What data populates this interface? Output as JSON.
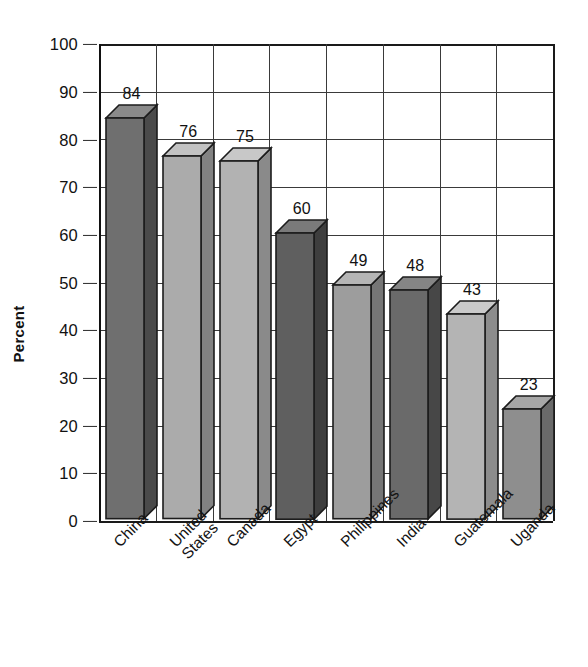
{
  "chart_data": {
    "type": "bar",
    "title": "",
    "xlabel": "",
    "ylabel": "Percent",
    "ylim": [
      0,
      100
    ],
    "ytick_step": 10,
    "yticks": [
      100,
      90,
      80,
      70,
      60,
      50,
      40,
      30,
      20,
      10,
      0
    ],
    "grid": "both",
    "legend": "none",
    "style": "3d-bar-grayscale",
    "categories": [
      "China",
      "United States",
      "Canada",
      "Egypt",
      "Philippines",
      "India",
      "Guatemala",
      "Uganda"
    ],
    "category_lines": [
      [
        "China"
      ],
      [
        "United",
        "States"
      ],
      [
        "Canada"
      ],
      [
        "Egypt"
      ],
      [
        "Philippines"
      ],
      [
        "India"
      ],
      [
        "Guatemala"
      ],
      [
        "Uganda"
      ]
    ],
    "values": [
      84,
      76,
      75,
      60,
      49,
      48,
      43,
      23
    ],
    "value_labels": [
      "84",
      "76",
      "75",
      "60",
      "49",
      "48",
      "43",
      "23"
    ],
    "bar_colors": [
      "#6f6f6f",
      "#ababab",
      "#b2b2b2",
      "#5f5f5f",
      "#9d9d9d",
      "#6a6a6a",
      "#b4b4b4",
      "#8e8e8e"
    ],
    "bar_side_colors": [
      "#4a4a4a",
      "#828282",
      "#8a8a8a",
      "#3e3e3e",
      "#767676",
      "#474747",
      "#8c8c8c",
      "#6a6a6a"
    ],
    "bar_top_colors": [
      "#8a8a8a",
      "#c2c2c2",
      "#c8c8c8",
      "#7a7a7a",
      "#b5b5b5",
      "#858585",
      "#cacaca",
      "#a7a7a7"
    ]
  },
  "axis": {
    "grid_color": "#3a3a3a",
    "axis_color": "#111111",
    "text_color": "#111111"
  }
}
